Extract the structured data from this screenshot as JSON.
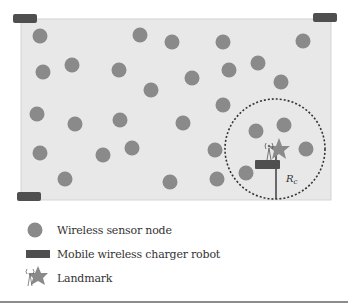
{
  "diagram": {
    "field_color": "#e8e8e8",
    "field_border": "#d4d4d4",
    "node_color": "#8a8a8a",
    "robot_color": "#4f4f4f",
    "landmark_color": "#8a8a8a",
    "radius_label": "R",
    "radius_subscript": "c",
    "sensor_nodes": [
      [
        40,
        36
      ],
      [
        140,
        35
      ],
      [
        172,
        42
      ],
      [
        223,
        42
      ],
      [
        303,
        41
      ],
      [
        43,
        72
      ],
      [
        72,
        65
      ],
      [
        119,
        70
      ],
      [
        192,
        78
      ],
      [
        229,
        70
      ],
      [
        258,
        63
      ],
      [
        281,
        82
      ],
      [
        151,
        90
      ],
      [
        223,
        105
      ],
      [
        37,
        114
      ],
      [
        75,
        124
      ],
      [
        120,
        120
      ],
      [
        183,
        123
      ],
      [
        256,
        131
      ],
      [
        284,
        125
      ],
      [
        40,
        153
      ],
      [
        103,
        155
      ],
      [
        132,
        148
      ],
      [
        215,
        150
      ],
      [
        306,
        149
      ],
      [
        65,
        179
      ],
      [
        170,
        182
      ],
      [
        217,
        179
      ],
      [
        246,
        173
      ]
    ]
  },
  "legend": {
    "items": [
      {
        "icon": "sensor-node-icon",
        "label": "Wireless sensor node"
      },
      {
        "icon": "charger-robot-icon",
        "label": "Mobile wireless charger robot"
      },
      {
        "icon": "landmark-icon",
        "label": "Landmark"
      }
    ]
  }
}
